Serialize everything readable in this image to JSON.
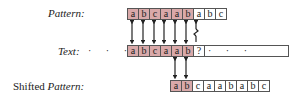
{
  "labels": {
    "pattern": "Pattern:",
    "text": "Text:",
    "shifted_prefix": "Shifted ",
    "shifted_pattern": "Pattern:"
  },
  "pattern": {
    "chars": [
      "a",
      "b",
      "c",
      "a",
      "a",
      "b",
      "a",
      "b",
      "c"
    ],
    "highlighted_count": 6
  },
  "text": {
    "leading_dots": "· · ·",
    "chars": [
      "a",
      "b",
      "c",
      "a",
      "a",
      "b",
      "?"
    ],
    "highlighted_count": 6,
    "trailing_dots": "· · ·"
  },
  "shifted_pattern": {
    "chars": [
      "a",
      "b",
      "c",
      "a",
      "a",
      "b",
      "a",
      "b",
      "c"
    ],
    "highlighted_count": 2
  },
  "colors": {
    "highlight": "#d9a9a9",
    "border": "#555555"
  }
}
